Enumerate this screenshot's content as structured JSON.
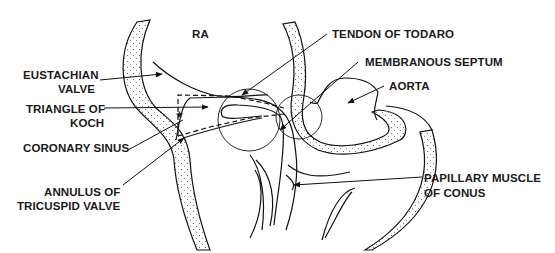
{
  "diagram": {
    "type": "anatomical-line-drawing",
    "colors": {
      "ink": "#111111",
      "background": "#ffffff",
      "stipple": "#555555"
    },
    "region_label": "RA",
    "labels": {
      "tendon_of_todaro": "TENDON OF TODARO",
      "membranous_septum": "MEMBRANOUS SEPTUM",
      "aorta": "AORTA",
      "eustachian_valve_1": "EUSTACHIAN",
      "eustachian_valve_2": "VALVE",
      "triangle_of_koch_1": "TRIANGLE OF",
      "triangle_of_koch_2": "KOCH",
      "coronary_sinus": "CORONARY SINUS",
      "annulus_1": "ANNULUS OF",
      "annulus_2": "TRICUSPID VALVE",
      "papillary_1": "PAPILLARY MUSCLE",
      "papillary_2": "OF CONUS"
    }
  }
}
